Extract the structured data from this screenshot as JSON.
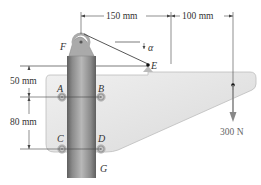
{
  "diagram": {
    "type": "statics-mechanism",
    "dimensions": {
      "horizontal_1": "150 mm",
      "horizontal_2": "100 mm",
      "vertical_1": "50 mm",
      "vertical_2": "80 mm"
    },
    "angle_label": "α",
    "points": {
      "A": "A",
      "B": "B",
      "C": "C",
      "D": "D",
      "E": "E",
      "F": "F",
      "G": "G"
    },
    "load": "300 N",
    "colors": {
      "plate": "#e4e4e4",
      "plate_edge": "#b8b8b8",
      "post_dark": "#6e6e6e",
      "post_light": "#b2b2b2",
      "line": "#444444",
      "load_arrow": "#888888"
    }
  }
}
